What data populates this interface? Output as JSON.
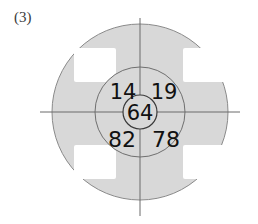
{
  "figure": {
    "label": "(3)",
    "caption_position": "top-left"
  },
  "diagram": {
    "type": "concentric-circle-target-with-quadrant-values",
    "background_color": "#ffffff",
    "fill_color": "#d8d8d8",
    "stroke_color": "#8a8a8a",
    "text_color": "#111111",
    "white_patch_color": "#ffffff",
    "center": {
      "x": 140,
      "y": 112
    },
    "outer_circle": {
      "radius": 88
    },
    "middle_circle": {
      "radius": 45
    },
    "inner_circle": {
      "radius": 17
    },
    "axis_lines": {
      "horizontal": {
        "x1": 40,
        "x2": 240,
        "y": 112
      },
      "vertical": {
        "x": 140,
        "y1": 18,
        "y2": 216
      }
    },
    "white_patches": [
      {
        "name": "top-left-patch",
        "x": 74,
        "y": 48,
        "width": 42,
        "height": 34
      },
      {
        "name": "top-right-patch",
        "x": 183,
        "y": 48,
        "width": 42,
        "height": 34
      },
      {
        "name": "bottom-left-patch",
        "x": 74,
        "y": 145,
        "width": 42,
        "height": 34
      },
      {
        "name": "bottom-right-patch",
        "x": 183,
        "y": 145,
        "width": 42,
        "height": 34
      }
    ],
    "values": {
      "top_left": "14",
      "top_right": "19",
      "center": "64",
      "bottom_left": "82",
      "bottom_right": "78"
    }
  }
}
